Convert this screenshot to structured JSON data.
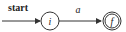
{
  "diagram": {
    "type": "finite-automaton",
    "start_label": "start",
    "states": [
      {
        "id": "i",
        "label": "i",
        "accepting": false,
        "initial": true
      },
      {
        "id": "f",
        "label": "f",
        "accepting": true,
        "initial": false
      }
    ],
    "transitions": [
      {
        "from": "i",
        "to": "f",
        "label": "a"
      }
    ],
    "colors": {
      "stroke": "#333333",
      "background": "#ffffff"
    }
  }
}
